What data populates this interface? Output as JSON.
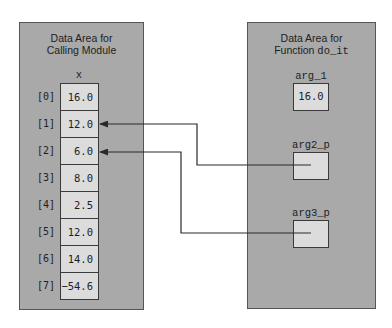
{
  "left_panel": {
    "title_line1": "Data Area for",
    "title_line2": "Calling Module",
    "array_name": "x",
    "cells": [
      {
        "index": "[0]",
        "value": "16.0"
      },
      {
        "index": "[1]",
        "value": "12.0"
      },
      {
        "index": "[2]",
        "value": "6.0"
      },
      {
        "index": "[3]",
        "value": "8.0"
      },
      {
        "index": "[4]",
        "value": "2.5"
      },
      {
        "index": "[5]",
        "value": "12.0"
      },
      {
        "index": "[6]",
        "value": "14.0"
      },
      {
        "index": "[7]",
        "value": "−54.6"
      }
    ]
  },
  "right_panel": {
    "title_line1": "Data Area for",
    "title_line2_prefix": "Function ",
    "title_line2_code": "do_it",
    "vars": [
      {
        "name": "arg_1",
        "value": "16.0"
      },
      {
        "name": "arg2_p",
        "value": ""
      },
      {
        "name": "arg3_p",
        "value": ""
      }
    ]
  },
  "pointers": [
    {
      "from": "arg2_p",
      "to": "x[1]"
    },
    {
      "from": "arg3_p",
      "to": "x[2]"
    }
  ],
  "colors": {
    "panel": "#a9a9a9",
    "cell": "#dcdcdc",
    "border": "#3a3a3a",
    "arrow": "#2a2a2a"
  }
}
